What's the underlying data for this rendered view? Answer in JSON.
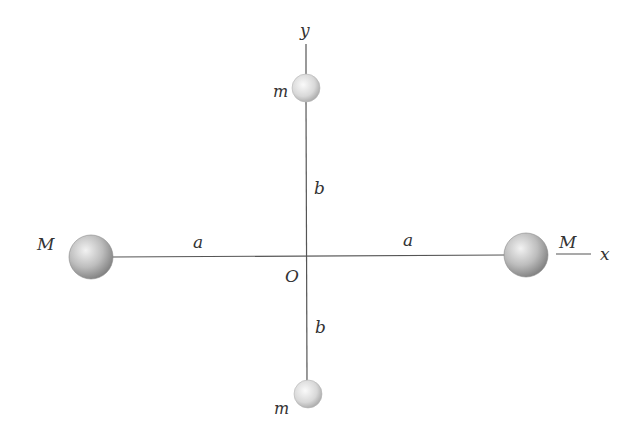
{
  "diagram": {
    "labels": {
      "y_axis": "y",
      "x_axis": "x",
      "origin": "O",
      "mass_top": "m",
      "mass_bottom": "m",
      "mass_left": "M",
      "mass_right": "M",
      "dist_left": "a",
      "dist_right": "a",
      "dist_top": "b",
      "dist_bottom": "b"
    },
    "colors": {
      "line": "#555555",
      "text": "#333333",
      "sphere_light": "#f4f4f4",
      "sphere_dark": "#8a8a8a"
    }
  }
}
